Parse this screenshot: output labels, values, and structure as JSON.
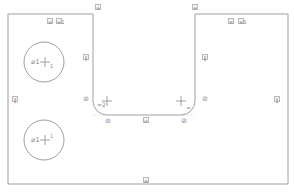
{
  "sketch": {
    "stroke_color": "#a0a0a0",
    "profile": {
      "outer_left": 8,
      "outer_right": 288,
      "top": 14,
      "bottom": 184,
      "slot_left": 93,
      "slot_right": 195,
      "slot_bottom": 115,
      "fillet_radius": 14
    },
    "circles": [
      {
        "cx": 44,
        "cy": 62,
        "r": 20,
        "label": "⌀1",
        "mark": "+",
        "sub": "1"
      },
      {
        "cx": 44,
        "cy": 140,
        "r": 20,
        "label": "⌀1",
        "mark": "+",
        "sub": "1"
      }
    ],
    "constraints": [
      {
        "name": "horizontal-top-left",
        "x": 47,
        "y": 20,
        "text": "="
      },
      {
        "name": "equal-top-left",
        "x": 57,
        "y": 20,
        "text": "=1"
      },
      {
        "name": "horizontal-top-right",
        "x": 228,
        "y": 20,
        "text": "="
      },
      {
        "name": "equal-top-right",
        "x": 240,
        "y": 20,
        "text": "=1"
      },
      {
        "name": "vertical-left-outer",
        "x": 12,
        "y": 98,
        "text": "‖"
      },
      {
        "name": "vertical-left-slot",
        "x": 84,
        "y": 55,
        "text": "‖"
      },
      {
        "name": "vertical-right-slot",
        "x": 204,
        "y": 55,
        "text": "‖"
      },
      {
        "name": "vertical-right-outer",
        "x": 274,
        "y": 98,
        "text": "‖"
      },
      {
        "name": "horizontal-slot-top-left",
        "x": 96,
        "y": 5,
        "text": "="
      },
      {
        "name": "horizontal-slot-top-right",
        "x": 193,
        "y": 5,
        "text": "="
      },
      {
        "name": "tangent-left-upper",
        "x": 83,
        "y": 98,
        "text": "⊘"
      },
      {
        "name": "tangent-left-lower",
        "x": 106,
        "y": 119,
        "text": "⊘"
      },
      {
        "name": "tangent-right-upper",
        "x": 202,
        "y": 98,
        "text": "⊘"
      },
      {
        "name": "tangent-right-lower",
        "x": 181,
        "y": 119,
        "text": "⊘"
      },
      {
        "name": "equal-fillet-left",
        "x": 98,
        "y": 99,
        "text": "=2"
      },
      {
        "name": "equal-fillet-right",
        "x": 187,
        "y": 105,
        "text": "="
      },
      {
        "name": "horizontal-slot-bottom",
        "x": 143,
        "y": 118,
        "text": "="
      },
      {
        "name": "horizontal-bottom",
        "x": 143,
        "y": 178,
        "text": "="
      }
    ]
  }
}
